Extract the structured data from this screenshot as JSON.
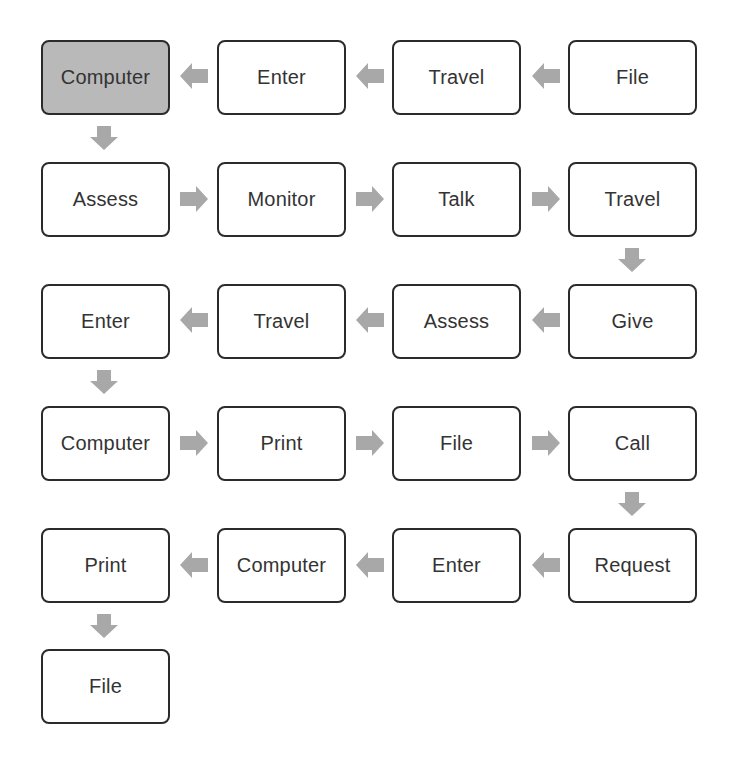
{
  "diagram": {
    "type": "process-flow",
    "colors": {
      "box_border": "#2b2b2b",
      "box_fill": "#ffffff",
      "highlight_fill": "#b9b9b9",
      "arrow_fill": "#a8a8a8",
      "text": "#333333"
    },
    "rows": [
      {
        "direction": "right-to-left",
        "nodes": [
          "Computer",
          "Enter",
          "Travel",
          "File"
        ]
      },
      {
        "direction": "left-to-right",
        "nodes": [
          "Assess",
          "Monitor",
          "Talk",
          "Travel"
        ]
      },
      {
        "direction": "right-to-left",
        "nodes": [
          "Enter",
          "Travel",
          "Assess",
          "Give"
        ]
      },
      {
        "direction": "left-to-right",
        "nodes": [
          "Computer",
          "Print",
          "File",
          "Call"
        ]
      },
      {
        "direction": "right-to-left",
        "nodes": [
          "Print",
          "Computer",
          "Enter",
          "Request"
        ]
      },
      {
        "direction": "end",
        "nodes": [
          "File"
        ]
      }
    ],
    "highlighted_node": "Computer",
    "sequence": [
      "File",
      "Travel",
      "Enter",
      "Computer",
      "Assess",
      "Monitor",
      "Talk",
      "Travel",
      "Give",
      "Assess",
      "Travel",
      "Enter",
      "Computer",
      "Print",
      "File",
      "Call",
      "Request",
      "Enter",
      "Computer",
      "Print",
      "File"
    ]
  }
}
